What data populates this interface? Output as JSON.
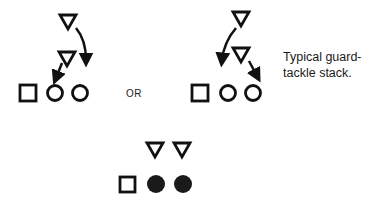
{
  "diagram": {
    "or_label": "OR",
    "caption_line1": "Typical guard-",
    "caption_line2": "tackle stack.",
    "colors": {
      "stroke": "#111111",
      "fill_solid": "#1a1a1a",
      "background": "#ffffff"
    },
    "formations": [
      {
        "name": "left-stack",
        "defenders": [
          "triangle",
          "triangle"
        ],
        "offense": [
          "square",
          "circle",
          "circle"
        ],
        "arrows": 2
      },
      {
        "name": "right-stack",
        "defenders": [
          "triangle",
          "triangle"
        ],
        "offense": [
          "square",
          "circle",
          "circle"
        ],
        "arrows": 2
      },
      {
        "name": "bottom-stack",
        "defenders": [
          "triangle",
          "triangle"
        ],
        "offense": [
          "square",
          "filled-circle",
          "filled-circle"
        ],
        "arrows": 0
      }
    ]
  }
}
